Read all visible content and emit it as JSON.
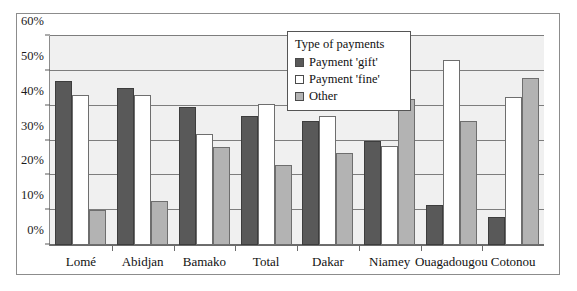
{
  "chart_data": {
    "type": "bar",
    "title": "",
    "xlabel": "",
    "ylabel": "",
    "ylim": [
      0,
      60
    ],
    "ytick_labels": [
      "0%",
      "10%",
      "20%",
      "30%",
      "40%",
      "50%",
      "60%"
    ],
    "ytick_values": [
      0,
      10,
      20,
      30,
      40,
      50,
      60
    ],
    "grid": true,
    "legend_position": "inside-top-center",
    "legend_title": "Type of payments",
    "categories": [
      "Lomé",
      "Abidjan",
      "Bamako",
      "Total",
      "Dakar",
      "Niamey",
      "Ouagadougou",
      "Cotonou"
    ],
    "series": [
      {
        "name": "Payment 'gift'",
        "color": "#595959",
        "values": [
          47,
          45,
          39.5,
          37,
          35.5,
          30,
          11.5,
          8
        ]
      },
      {
        "name": "Payment 'fine'",
        "color": "#ffffff",
        "values": [
          43,
          43,
          32,
          40.5,
          37,
          28.5,
          53,
          42.5
        ]
      },
      {
        "name": "Other",
        "color": "#b3b3b3",
        "values": [
          10,
          12.5,
          28,
          23,
          26.5,
          42,
          35.5,
          48
        ]
      }
    ]
  }
}
